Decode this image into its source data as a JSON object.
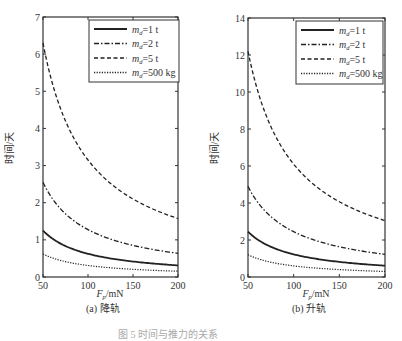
{
  "figure_caption": "图 5  时间与推力的关系",
  "chart_data": [
    {
      "type": "line",
      "title": "",
      "subcaption": "(a) 降轨",
      "xlabel": "F_p/mN",
      "xlabel_main": "F",
      "xlabel_sub": "p",
      "xlabel_unit": "/mN",
      "ylabel": "时间/天",
      "xlim": [
        50,
        200
      ],
      "ylim": [
        0,
        7
      ],
      "xticks": [
        50,
        100,
        150,
        200
      ],
      "yticks": [
        0,
        1,
        2,
        3,
        4,
        5,
        6,
        7
      ],
      "grid": false,
      "legend_position": "upper right",
      "x": [
        50,
        60,
        70,
        80,
        90,
        100,
        110,
        120,
        130,
        140,
        150,
        160,
        170,
        180,
        190,
        200
      ],
      "series": [
        {
          "name": "m_d=1 t",
          "style": "solid",
          "values": [
            1.25,
            1.04,
            0.89,
            0.78,
            0.69,
            0.63,
            0.57,
            0.52,
            0.48,
            0.45,
            0.42,
            0.39,
            0.37,
            0.35,
            0.33,
            0.31
          ]
        },
        {
          "name": "m_d=2 t",
          "style": "dashdot",
          "values": [
            2.55,
            2.13,
            1.82,
            1.59,
            1.42,
            1.28,
            1.16,
            1.06,
            0.98,
            0.91,
            0.85,
            0.8,
            0.75,
            0.71,
            0.67,
            0.64
          ]
        },
        {
          "name": "m_d=5 t",
          "style": "dashed",
          "values": [
            6.3,
            5.25,
            4.5,
            3.94,
            3.5,
            3.15,
            2.86,
            2.63,
            2.42,
            2.25,
            2.1,
            1.97,
            1.85,
            1.75,
            1.66,
            1.575
          ]
        },
        {
          "name": "m_d=500 kg",
          "style": "dotted",
          "values": [
            0.62,
            0.52,
            0.44,
            0.39,
            0.34,
            0.31,
            0.28,
            0.26,
            0.24,
            0.22,
            0.21,
            0.19,
            0.18,
            0.17,
            0.16,
            0.155
          ]
        }
      ]
    },
    {
      "type": "line",
      "title": "",
      "subcaption": "(b) 升轨",
      "xlabel": "F_p/mN",
      "xlabel_main": "F",
      "xlabel_sub": "p",
      "xlabel_unit": "/mN",
      "ylabel": "时间/天",
      "xlim": [
        50,
        200
      ],
      "ylim": [
        0,
        14
      ],
      "xticks": [
        50,
        100,
        150,
        200
      ],
      "yticks": [
        0,
        2,
        4,
        6,
        8,
        10,
        12,
        14
      ],
      "grid": false,
      "legend_position": "upper right",
      "x": [
        50,
        60,
        70,
        80,
        90,
        100,
        110,
        120,
        130,
        140,
        150,
        160,
        170,
        180,
        190,
        200
      ],
      "series": [
        {
          "name": "m_d=1 t",
          "style": "solid",
          "values": [
            2.45,
            2.04,
            1.75,
            1.53,
            1.36,
            1.23,
            1.11,
            1.02,
            0.94,
            0.88,
            0.82,
            0.77,
            0.72,
            0.68,
            0.64,
            0.61
          ]
        },
        {
          "name": "m_d=2 t",
          "style": "dashdot",
          "values": [
            4.9,
            4.08,
            3.5,
            3.06,
            2.72,
            2.45,
            2.23,
            2.04,
            1.88,
            1.75,
            1.63,
            1.53,
            1.44,
            1.36,
            1.29,
            1.23
          ]
        },
        {
          "name": "m_d=5 t",
          "style": "dashed",
          "values": [
            12.2,
            10.17,
            8.71,
            7.63,
            6.78,
            6.1,
            5.55,
            5.08,
            4.69,
            4.36,
            4.07,
            3.81,
            3.59,
            3.39,
            3.21,
            3.05
          ]
        },
        {
          "name": "m_d=500 kg",
          "style": "dotted",
          "values": [
            1.2,
            1.0,
            0.86,
            0.75,
            0.67,
            0.6,
            0.55,
            0.5,
            0.46,
            0.43,
            0.4,
            0.38,
            0.35,
            0.33,
            0.32,
            0.3
          ]
        }
      ]
    }
  ],
  "legend": [
    {
      "label_main": "m",
      "label_sub": "d",
      "label_rest": "=1 t"
    },
    {
      "label_main": "m",
      "label_sub": "d",
      "label_rest": "=2 t"
    },
    {
      "label_main": "m",
      "label_sub": "d",
      "label_rest": "=5 t"
    },
    {
      "label_main": "m",
      "label_sub": "d",
      "label_rest": "=500 kg"
    }
  ]
}
